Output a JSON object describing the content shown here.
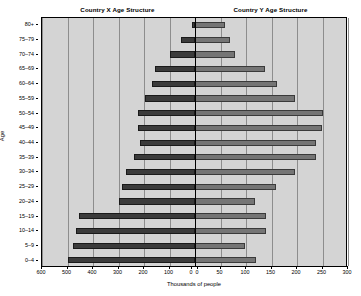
{
  "titles": {
    "left": "Country X Age Structure",
    "right": "Country Y Age Structure"
  },
  "axes": {
    "x_title": "Thousands of people",
    "y_title": "Age",
    "left_ticks": [
      "600",
      "500",
      "400",
      "300",
      "200",
      "100",
      "0"
    ],
    "right_ticks": [
      "0",
      "50",
      "100",
      "150",
      "200",
      "250",
      "300"
    ]
  },
  "chart_data": {
    "type": "bar",
    "subtype": "population-pyramid",
    "xlabel": "Thousands of people",
    "ylabel": "Age",
    "grid": true,
    "legend": "none",
    "orientation": "horizontal",
    "categories": [
      "80+",
      "75-79",
      "70-74",
      "65-69",
      "60-64",
      "55-59",
      "50-54",
      "45-49",
      "40-44",
      "35-39",
      "30-34",
      "25-29",
      "20-24",
      "15-19",
      "10-14",
      "5-9",
      "0-4"
    ],
    "left_axis": {
      "name": "Country X",
      "direction": "left",
      "xlim": [
        0,
        600
      ],
      "ticks": [
        0,
        100,
        200,
        300,
        400,
        500,
        600
      ],
      "color": "#3b3b3b"
    },
    "right_axis": {
      "name": "Country Y",
      "direction": "right",
      "xlim": [
        0,
        300
      ],
      "ticks": [
        0,
        50,
        100,
        150,
        200,
        250,
        300
      ],
      "color": "#757575"
    },
    "series": [
      {
        "name": "Country X",
        "axis": "left",
        "values": [
          10,
          55,
          100,
          155,
          170,
          195,
          225,
          225,
          215,
          240,
          270,
          285,
          300,
          455,
          465,
          480,
          500
        ]
      },
      {
        "name": "Country Y",
        "axis": "right",
        "values": [
          58,
          68,
          78,
          138,
          160,
          197,
          250,
          249,
          238,
          238,
          197,
          159,
          118,
          139,
          139,
          99,
          120
        ]
      }
    ]
  }
}
